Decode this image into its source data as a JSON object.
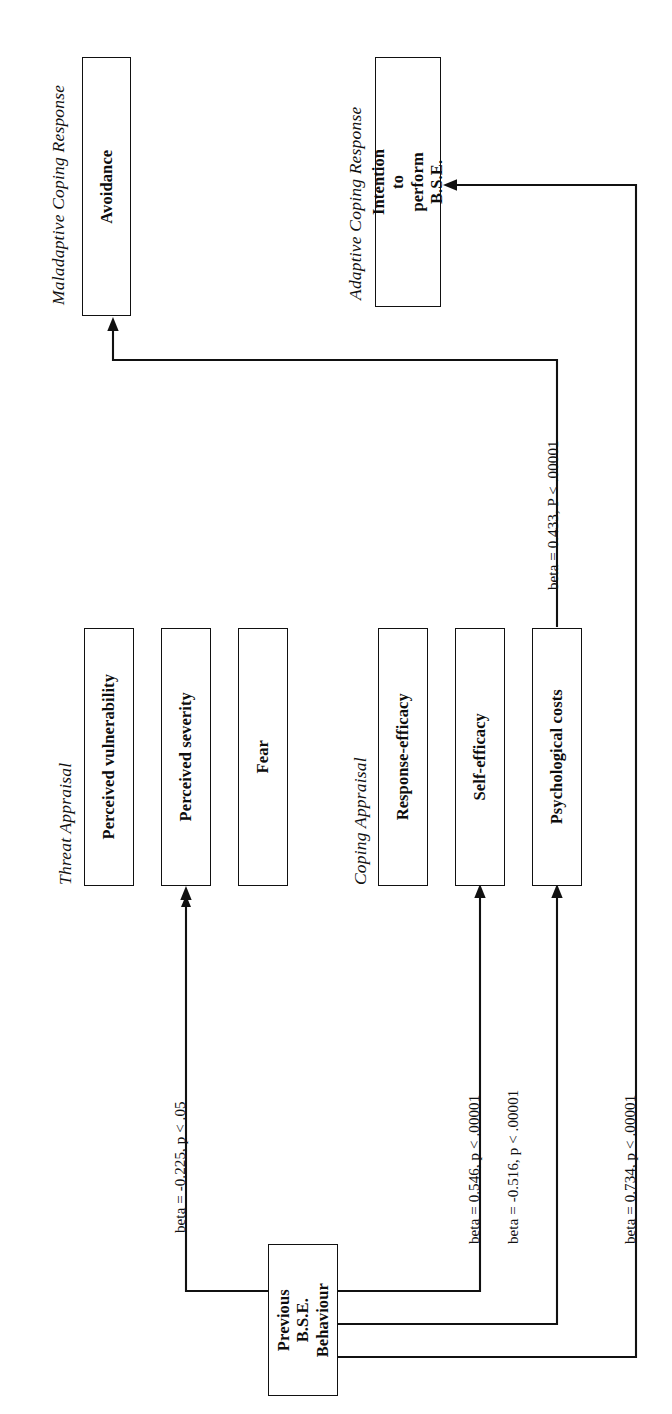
{
  "figure": {
    "orientation": "rotated-90-ccw",
    "line_color": "#111111",
    "background": "#ffffff"
  },
  "sections": [
    {
      "id": "maladaptive",
      "label": "Maladaptive Coping Response"
    },
    {
      "id": "adaptive",
      "label": "Adaptive Coping Response"
    },
    {
      "id": "threat",
      "label": "Threat Appraisal"
    },
    {
      "id": "coping",
      "label": "Coping Appraisal"
    }
  ],
  "nodes": [
    {
      "id": "avoidance",
      "label": "Avoidance",
      "section": "maladaptive"
    },
    {
      "id": "intention",
      "label": "Intention to perform\nB.S.E.",
      "section": "adaptive"
    },
    {
      "id": "perceived_vulnerability",
      "label": "Perceived vulnerability",
      "section": "threat"
    },
    {
      "id": "perceived_severity",
      "label": "Perceived severity",
      "section": "threat"
    },
    {
      "id": "fear",
      "label": "Fear",
      "section": "threat"
    },
    {
      "id": "response_efficacy",
      "label": "Response-efficacy",
      "section": "coping"
    },
    {
      "id": "self_efficacy",
      "label": "Self-efficacy",
      "section": "coping"
    },
    {
      "id": "psychological_costs",
      "label": "Psychological costs",
      "section": "coping"
    },
    {
      "id": "previous_behaviour",
      "label": "Previous B.S.E.\nBehaviour",
      "section": "predictor"
    }
  ],
  "edges": [
    {
      "id": "edge_severity",
      "from": "previous_behaviour",
      "to": "perceived_severity",
      "label": "beta = -0.225, p < .05",
      "beta": -0.225,
      "p": "< .05"
    },
    {
      "id": "edge_self_efficacy",
      "from": "previous_behaviour",
      "to": "self_efficacy",
      "label": "beta = 0.546, p < .00001",
      "beta": 0.546,
      "p": "< .00001"
    },
    {
      "id": "edge_psych_costs",
      "from": "previous_behaviour",
      "to": "psychological_costs",
      "label": "beta = -0.516, p < .00001",
      "beta": -0.516,
      "p": "< .00001"
    },
    {
      "id": "edge_intention",
      "from": "previous_behaviour",
      "to": "intention",
      "label": "beta = 0.734, p < .00001",
      "beta": 0.734,
      "p": "< .00001"
    },
    {
      "id": "edge_avoidance",
      "from": "psychological_costs",
      "to": "avoidance",
      "label": "beta = 0.433, P < .00001",
      "beta": 0.433,
      "p": "< .00001"
    }
  ]
}
